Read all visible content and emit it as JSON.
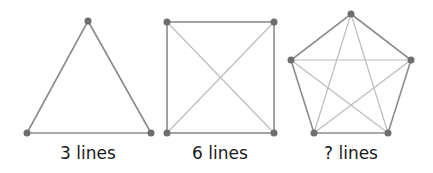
{
  "diagram": {
    "colors": {
      "edge": "#8c8c8c",
      "diagonal": "#bdbdbd",
      "vertex": "#6e6e6e",
      "text": "#1a1a1a"
    },
    "figures": [
      {
        "shape": "triangle",
        "label": "3 lines",
        "vertices": [
          [
            88,
            21
          ],
          [
            27,
            133
          ],
          [
            151,
            133
          ]
        ]
      },
      {
        "shape": "square",
        "label": "6 lines",
        "vertices": [
          [
            167,
            22
          ],
          [
            274,
            22
          ],
          [
            274,
            133
          ],
          [
            167,
            133
          ]
        ]
      },
      {
        "shape": "pentagon",
        "label": "? lines",
        "vertices": [
          [
            351,
            14
          ],
          [
            411,
            60
          ],
          [
            388,
            133
          ],
          [
            314,
            133
          ],
          [
            291,
            60
          ]
        ]
      }
    ]
  }
}
